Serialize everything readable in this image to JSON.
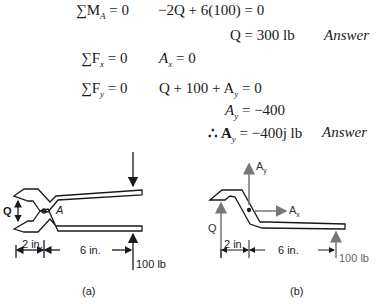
{
  "equations": {
    "moment": {
      "lhs": "∑M",
      "lhs_sub": "A",
      "lhs_rest": " = 0",
      "rhs": "−2Q + 6(100) = 0"
    },
    "q_result": {
      "text": "Q = 300 lb",
      "answer": "Answer"
    },
    "fx": {
      "lhs": "∑F",
      "lhs_sub": "x",
      "lhs_rest": " = 0",
      "rhs_var": "A",
      "rhs_sub": "x",
      "rhs_rest": " = 0"
    },
    "fy": {
      "lhs": "∑F",
      "lhs_sub": "y",
      "lhs_rest": " = 0",
      "rhs": "Q + 100 + A",
      "rhs_sub": "y",
      "rhs_rest": " = 0"
    },
    "ay": {
      "var": "A",
      "sub": "y",
      "rest": " = −400"
    },
    "ay_vec": {
      "prefix": "∴ A",
      "sub": "y",
      "rest": " = −400j lb",
      "answer": "Answer"
    }
  },
  "figure_a": {
    "caption": "(a)",
    "q_label": "Q",
    "pivot_label": "A",
    "dim1": "2 in.",
    "dim2": "6 in.",
    "force": "100 lb"
  },
  "figure_b": {
    "caption": "(b)",
    "q_label": "Q",
    "ay_label": "A",
    "ay_sub": "y",
    "ax_label": "A",
    "ax_sub": "x",
    "dim1": "2 in.",
    "dim2": "6 in.",
    "force": "100 lb"
  },
  "colors": {
    "ink": "#1a1a1a",
    "gray": "#777777"
  }
}
